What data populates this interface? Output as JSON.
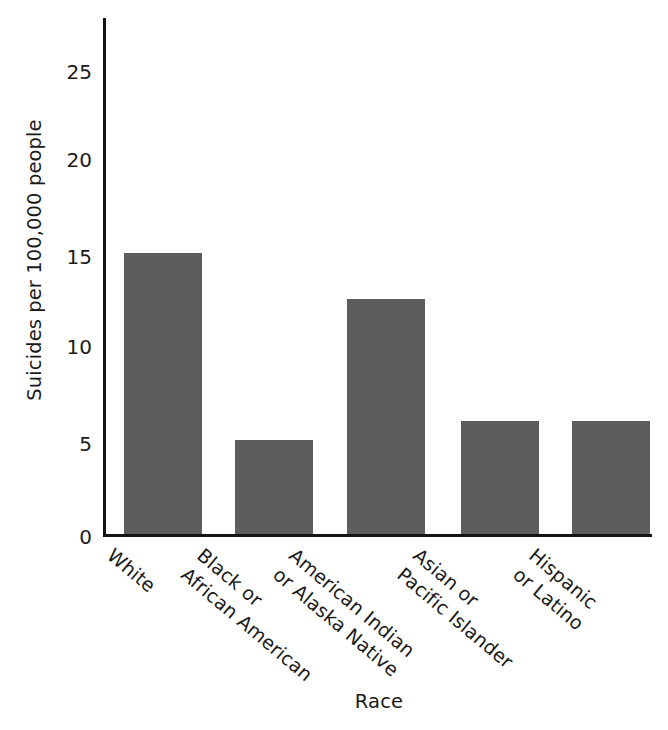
{
  "chart_data": {
    "type": "bar",
    "title": "",
    "subtitle": "",
    "xlabel": "Race",
    "ylabel": "Suicides per 100,000 people",
    "categories": [
      "White",
      "Black or\nAfrican American",
      "American Indian\nor Alaska Native",
      "Asian or\nPacific Islander",
      "Hispanic\nor Latino"
    ],
    "values": [
      15.0,
      5.0,
      12.5,
      6.0,
      6.0
    ],
    "ylim": [
      0,
      27.5
    ],
    "yticks": [
      0,
      5,
      10,
      15,
      20,
      25
    ],
    "ytick_labels": [
      "0",
      "5",
      "10",
      "15",
      "20",
      "25"
    ],
    "grid": false,
    "legend": false,
    "legend_position": "none",
    "bar_color": "#5d5d5d",
    "axis_color": "#141414",
    "text_color": "#1a1a1a",
    "background_color": "#ffffff",
    "xtick_label_rotation": 40,
    "annotations": []
  }
}
